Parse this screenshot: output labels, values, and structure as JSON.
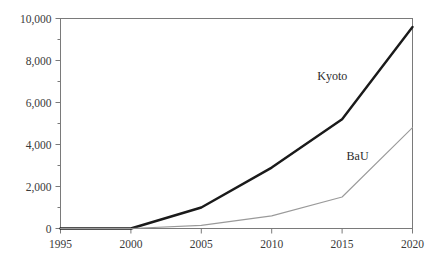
{
  "chart_data": {
    "type": "line",
    "title": "",
    "xlabel": "",
    "ylabel": "",
    "x": [
      1995,
      2000,
      2005,
      2010,
      2015,
      2020
    ],
    "xlim": [
      1995,
      2020
    ],
    "ylim": [
      0,
      10000
    ],
    "xticks": [
      "1995",
      "2000",
      "2005",
      "2010",
      "2015",
      "2020"
    ],
    "yticks": [
      "0",
      "2,000",
      "4,000",
      "6,000",
      "8,000",
      "10,000"
    ],
    "ytick_values": [
      0,
      2000,
      4000,
      6000,
      8000,
      10000
    ],
    "minor_ytick_values": [
      1000,
      3000,
      5000,
      7000,
      9000
    ],
    "grid": false,
    "legend_position": "inline-annotation",
    "series": [
      {
        "name": "Kyoto",
        "label": "Kyoto",
        "color": "#1a1a1a",
        "width": 2.4,
        "values": [
          0,
          0,
          1000,
          2900,
          5200,
          9600
        ],
        "label_x": 2014.3,
        "label_y": 7050
      },
      {
        "name": "BaU",
        "label": "BaU",
        "color": "#9a9a9a",
        "width": 1.1,
        "values": [
          0,
          0,
          150,
          600,
          1500,
          4800
        ],
        "label_x": 2016.1,
        "label_y": 3250
      }
    ]
  },
  "axes": {
    "frame_color": "#7a7a7a",
    "tick_color": "#7a7a7a",
    "label_color": "#3a3a3a"
  }
}
